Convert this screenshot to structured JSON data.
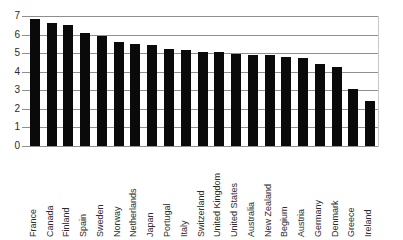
{
  "chart_data": {
    "type": "bar",
    "title": "",
    "subtitle": "",
    "xlabel": "",
    "ylabel": "",
    "ylim": [
      0,
      7
    ],
    "yticks": [
      0,
      1,
      2,
      3,
      4,
      5,
      6,
      7
    ],
    "ytick_labels": [
      "0",
      "1",
      "2",
      "3",
      "4",
      "5",
      "6",
      "7"
    ],
    "grid": true,
    "legend": false,
    "legend_position": "none",
    "bar_color": "#0a0a0a",
    "gridline_color": "#8f8f8f",
    "background_color": "#ffffff",
    "categories": [
      "France",
      "Canada",
      "Finland",
      "Spain",
      "Sweden",
      "Norway",
      "Netherlands",
      "Japan",
      "Portugal",
      "Italy",
      "Switzerland",
      "United Kingdom",
      "United States",
      "Australia",
      "New Zealand",
      "Begium",
      "Austria",
      "Germany",
      "Denmark",
      "Greece",
      "Ireland"
    ],
    "values": [
      6.85,
      6.65,
      6.5,
      6.1,
      5.9,
      5.6,
      5.5,
      5.45,
      5.25,
      5.15,
      5.08,
      5.05,
      4.97,
      4.9,
      4.88,
      4.8,
      4.72,
      4.4,
      4.28,
      3.05,
      2.45
    ]
  }
}
